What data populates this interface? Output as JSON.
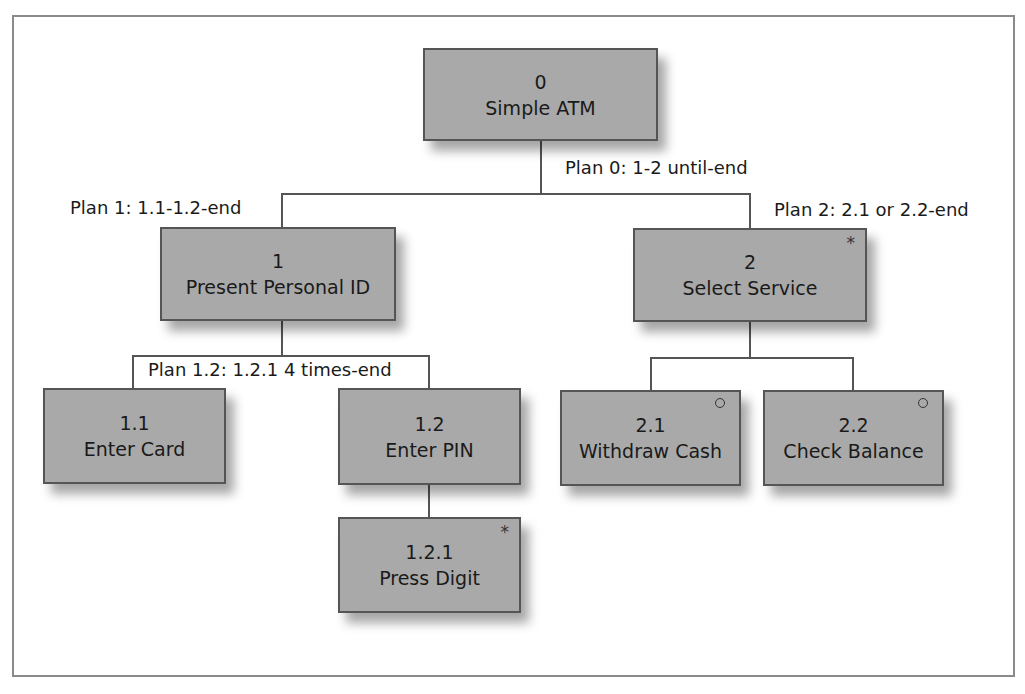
{
  "diagram": {
    "type": "hierarchical task analysis",
    "nodes": [
      {
        "id": "0",
        "label": "Simple ATM",
        "marker": ""
      },
      {
        "id": "1",
        "label": "Present Personal ID",
        "marker": ""
      },
      {
        "id": "2",
        "label": "Select Service",
        "marker": "*"
      },
      {
        "id": "1.1",
        "label": "Enter Card",
        "marker": ""
      },
      {
        "id": "1.2",
        "label": "Enter PIN",
        "marker": ""
      },
      {
        "id": "1.2.1",
        "label": "Press Digit",
        "marker": "*"
      },
      {
        "id": "2.1",
        "label": "Withdraw Cash",
        "marker": "o"
      },
      {
        "id": "2.2",
        "label": "Check Balance",
        "marker": "o"
      }
    ],
    "plans": {
      "plan0": "Plan 0: 1-2 until-end",
      "plan1": "Plan 1: 1.1-1.2-end",
      "plan2": "Plan 2: 2.1 or 2.2-end",
      "plan12": "Plan 1.2: 1.2.1 4 times-end"
    },
    "edges": [
      [
        "0",
        "1"
      ],
      [
        "0",
        "2"
      ],
      [
        "1",
        "1.1"
      ],
      [
        "1",
        "1.2"
      ],
      [
        "1.2",
        "1.2.1"
      ],
      [
        "2",
        "2.1"
      ],
      [
        "2",
        "2.2"
      ]
    ],
    "colors": {
      "node_fill": "#a9a9a9",
      "node_border": "#555555",
      "line": "#555555",
      "frame": "#8a8a8a"
    }
  }
}
